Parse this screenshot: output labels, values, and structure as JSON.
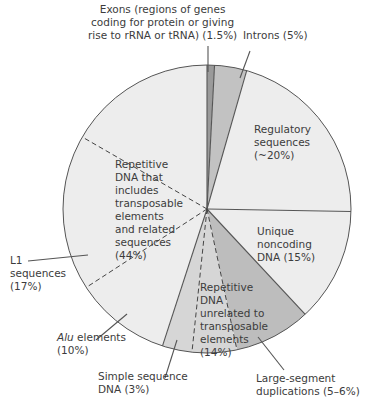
{
  "chart_data": {
    "type": "pie",
    "title": "",
    "start_angle_deg": 0,
    "direction": "clockwise",
    "slices": [
      {
        "name": "Exons (regions of genes coding for protein or giving rise to rRNA or tRNA)",
        "value": 1.5,
        "label": "(1.5%)",
        "start": 0,
        "end": 3,
        "color": "#9a9a9a"
      },
      {
        "name": "Introns",
        "value": 5,
        "label": "(5%)",
        "start": 3,
        "end": 16,
        "color": "#c2c2c2"
      },
      {
        "name": "Regulatory sequences",
        "value": 20,
        "label": "(~20%)",
        "start": 16,
        "end": 91,
        "color": "#ededed"
      },
      {
        "name": "Unique noncoding DNA",
        "value": 15,
        "label": "(15%)",
        "start": 91,
        "end": 137,
        "color": "#ededed"
      },
      {
        "name": "Large-segment duplications",
        "value": 5.5,
        "label": "(5–6%)",
        "start": 137,
        "end": 168,
        "color": "#bdbdbd"
      },
      {
        "name": "Repetitive DNA unrelated to transposable elements (other)",
        "value": 5.5,
        "label": "",
        "start": 168,
        "end": 186,
        "color": "#d6d6d6"
      },
      {
        "name": "Simple sequence DNA",
        "value": 3,
        "label": "(3%)",
        "start": 186,
        "end": 198,
        "color": "#d6d6d6"
      },
      {
        "name": "Alu elements",
        "value": 10,
        "label": "(10%)",
        "start": 198,
        "end": 237,
        "color": "#ededed"
      },
      {
        "name": "L1 sequences",
        "value": 17,
        "label": "(17%)",
        "start": 237,
        "end": 300,
        "color": "#ededed"
      },
      {
        "name": "Other transposable-element-related sequences",
        "value": 17,
        "label": "",
        "start": 300,
        "end": 360,
        "color": "#ededed"
      }
    ],
    "groups": [
      {
        "name": "Repetitive DNA that includes transposable elements and related sequences",
        "value": 44,
        "label": "(44%)"
      },
      {
        "name": "Repetitive DNA unrelated to transposable elements",
        "value": 14,
        "label": "(14%)"
      }
    ],
    "legend": "none (direct labels)"
  },
  "labels": {
    "exons": [
      "Exons (regions of genes",
      "coding for protein or giving",
      "rise to rRNA or tRNA) (1.5%)"
    ],
    "introns": "Introns (5%)",
    "regulatory": [
      "Regulatory",
      "sequences",
      "(~20%)"
    ],
    "unique": [
      "Unique",
      "noncoding",
      "DNA (15%)"
    ],
    "transposable": [
      "Repetitive",
      "DNA that",
      "includes",
      "transposable",
      "elements",
      "and related",
      "sequences",
      "(44%)"
    ],
    "l1": [
      "L1",
      "sequences",
      "(17%)"
    ],
    "alu_italic": "Alu",
    "alu_rest": " elements",
    "alu_pct": "(10%)",
    "unrelated": [
      "Repetitive",
      "DNA",
      "unrelated to",
      "transposable",
      "elements",
      "(14%)"
    ],
    "simple": [
      "Simple sequence",
      "DNA (3%)"
    ],
    "largeseg": [
      "Large-segment",
      "duplications (5–6%)"
    ]
  }
}
